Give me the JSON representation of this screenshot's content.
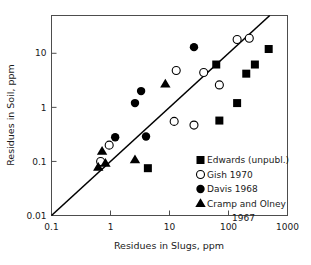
{
  "chart_data": {
    "type": "scatter",
    "title": "",
    "xlabel": "Residues in Slugs, ppm",
    "ylabel": "Residues in Soil, ppm",
    "xscale": "log",
    "yscale": "log",
    "xlim": [
      0.1,
      1000
    ],
    "ylim": [
      0.01,
      50
    ],
    "grid": false,
    "legend_position": "lower-right-inside",
    "xticks": [
      "0.1",
      "1",
      "10",
      "100",
      "1000"
    ],
    "xtick_values": [
      0.1,
      1,
      10,
      100,
      1000
    ],
    "yticks": [
      "0.01",
      "0.1",
      "1",
      "10"
    ],
    "ytick_values": [
      0.01,
      0.1,
      1,
      10
    ],
    "annotations": [
      {
        "name": "reference-line",
        "description": "straight diagonal reference line",
        "from": [
          0.1,
          0.01
        ],
        "to": [
          500,
          50
        ]
      }
    ],
    "series": [
      {
        "name": "Edwards (unpubl.)",
        "marker": "filled-square",
        "color": "#000000",
        "points": [
          [
            4.3,
            0.075
          ],
          [
            70,
            0.57
          ],
          [
            62,
            6.2
          ],
          [
            140,
            1.2
          ],
          [
            200,
            4.2
          ],
          [
            280,
            6.2
          ],
          [
            480,
            12
          ]
        ]
      },
      {
        "name": "Gish 1970",
        "marker": "open-circle",
        "color": "#000000",
        "points": [
          [
            0.68,
            0.1
          ],
          [
            0.95,
            0.2
          ],
          [
            12,
            0.55
          ],
          [
            13,
            4.8
          ],
          [
            26,
            0.47
          ],
          [
            38,
            4.4
          ],
          [
            70,
            2.6
          ],
          [
            140,
            18
          ],
          [
            225,
            19
          ]
        ]
      },
      {
        "name": "Davis 1968",
        "marker": "filled-circle",
        "color": "#000000",
        "points": [
          [
            1.2,
            0.28
          ],
          [
            2.6,
            1.2
          ],
          [
            3.3,
            2.0
          ],
          [
            4.0,
            0.29
          ],
          [
            26,
            13
          ]
        ]
      },
      {
        "name": "Cramp and Olney 1967",
        "marker": "filled-triangle",
        "color": "#000000",
        "points": [
          [
            0.62,
            0.078
          ],
          [
            0.72,
            0.155
          ],
          [
            0.82,
            0.093
          ],
          [
            2.6,
            0.108
          ],
          [
            8.5,
            2.7
          ]
        ]
      }
    ]
  },
  "axes": {
    "x_title": "Residues in Slugs, ppm",
    "y_title": "Residues in Soil, ppm",
    "x_tick_labels": [
      "0.1",
      "1",
      "10",
      "100",
      "1000"
    ],
    "y_tick_labels": [
      "0.01",
      "0.1",
      "1",
      "10"
    ]
  },
  "legend": {
    "entries": [
      {
        "label": "Edwards (unpubl.)",
        "marker": "filled-square"
      },
      {
        "label": "Gish 1970",
        "marker": "open-circle"
      },
      {
        "label": "Davis 1968",
        "marker": "filled-circle"
      },
      {
        "label": "Cramp and Olney",
        "marker": "filled-triangle"
      },
      {
        "label": "1967",
        "marker": "none"
      }
    ]
  }
}
